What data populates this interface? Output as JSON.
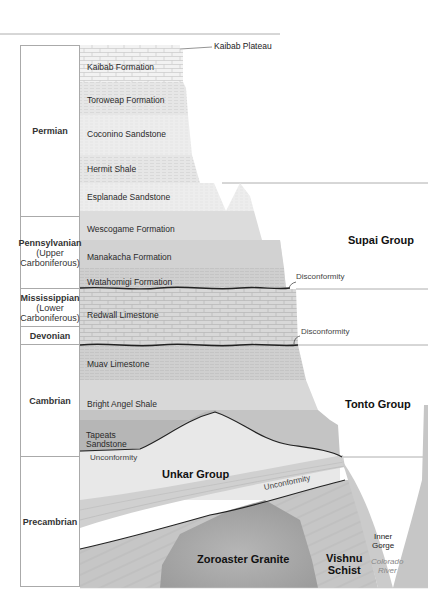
{
  "title_labels": {
    "plateau": "Kaibab Plateau"
  },
  "periods": [
    {
      "id": "permian",
      "lines": [
        "Permian"
      ],
      "top": 45,
      "bottom": 217
    },
    {
      "id": "pennsylvanian",
      "lines": [
        "Pennsylvanian",
        "(Upper",
        "Carboniferous)"
      ],
      "top": 217,
      "bottom": 289
    },
    {
      "id": "mississippian",
      "lines": [
        "Mississippian",
        "(Lower",
        "Carboniferous)"
      ],
      "top": 289,
      "bottom": 327
    },
    {
      "id": "devonian",
      "lines": [
        "Devonian"
      ],
      "top": 327,
      "bottom": 345
    },
    {
      "id": "cambrian",
      "lines": [
        "Cambrian"
      ],
      "top": 345,
      "bottom": 457
    },
    {
      "id": "precambrian",
      "lines": [
        "Precambrian"
      ],
      "top": 457,
      "bottom": 587
    }
  ],
  "formations": [
    {
      "name": "Kaibab Formation",
      "x": 87,
      "y": 67
    },
    {
      "name": "Toroweap Formation",
      "x": 87,
      "y": 100
    },
    {
      "name": "Coconino Sandstone",
      "x": 87,
      "y": 134
    },
    {
      "name": "Hermit Shale",
      "x": 87,
      "y": 169
    },
    {
      "name": "Esplanade Sandstone",
      "x": 87,
      "y": 197
    },
    {
      "name": "Wescogame Formation",
      "x": 87,
      "y": 229
    },
    {
      "name": "Manakacha Formation",
      "x": 87,
      "y": 257
    },
    {
      "name": "Watahomigi Formation",
      "x": 87,
      "y": 282
    },
    {
      "name": "Redwall Limestone",
      "x": 87,
      "y": 315
    },
    {
      "name": "Muav Limestone",
      "x": 87,
      "y": 364
    },
    {
      "name": "Bright Angel Shale",
      "x": 87,
      "y": 404
    }
  ],
  "tapeats": {
    "lines": [
      "Tapeats",
      "Sandstone"
    ]
  },
  "groups": {
    "supai": "Supai Group",
    "tonto": "Tonto Group",
    "unkar": "Unkar Group",
    "zoroaster": "Zoroaster Granite",
    "vishnu_line1": "Vishnu",
    "vishnu_line2": "Schist"
  },
  "annotations": {
    "disconformity_upper": "Disconformity",
    "disconformity_lower": "Disconformity",
    "unconformity_left": "Unconformity",
    "unconformity_right": "Unconformity",
    "inner_gorge_line1": "Inner",
    "inner_gorge_line2": "Gorge",
    "river_line1": "Colorado",
    "river_line2": "River"
  },
  "colors": {
    "light_rock": "#ececec",
    "mid_rock": "#d4d4d4",
    "dark_rock": "#b8b8b8",
    "granite": "#a8a8a8",
    "schist": "#c2c2c2",
    "line": "#888888",
    "contact": "#222222"
  }
}
